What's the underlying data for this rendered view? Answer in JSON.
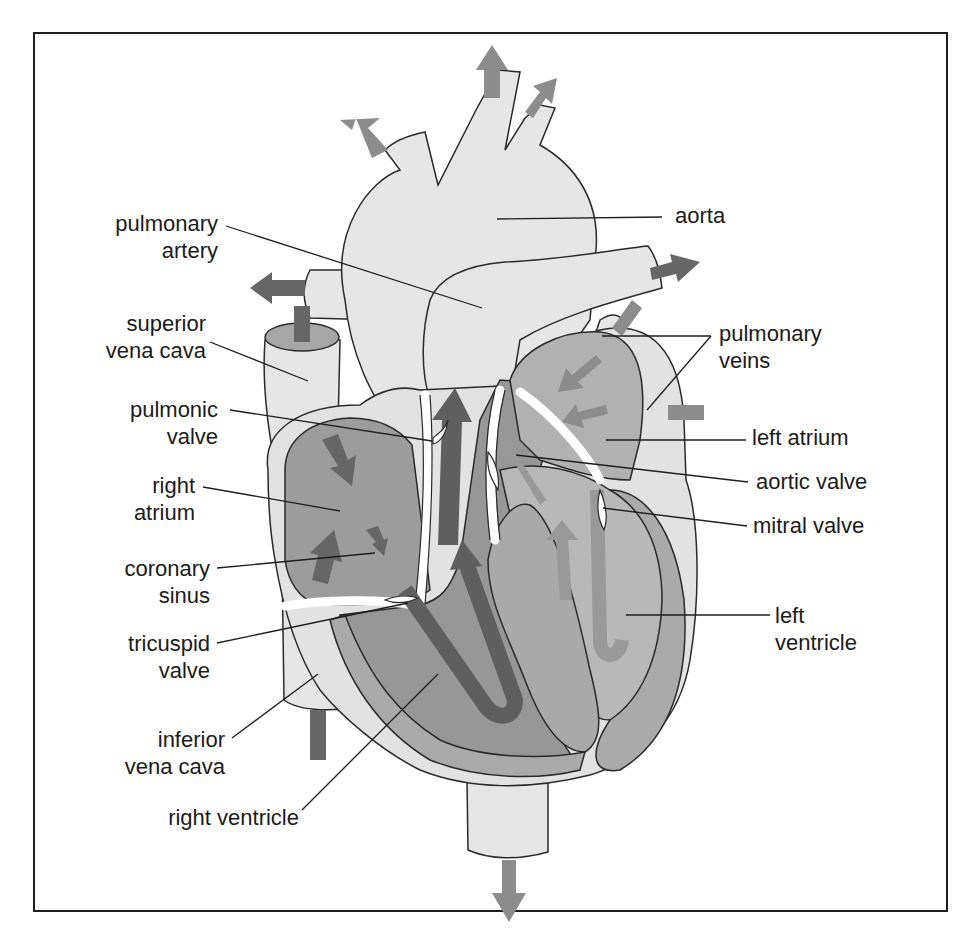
{
  "diagram": {
    "colors": {
      "background": "#ffffff",
      "frame": "#1f1f1f",
      "vessel_fill": "#e6e6e6",
      "chamber_right": "#9a9a9a",
      "chamber_left": "#b4b4b4",
      "muscle": "#a8a8a8",
      "arrow_dark": "#666666",
      "arrow_light": "#8e8e8e",
      "outline": "#2a2a2a",
      "text": "#1b1b1b"
    },
    "labels_left": [
      {
        "id": "pulmonary-artery",
        "lines": [
          "pulmonary",
          "artery"
        ]
      },
      {
        "id": "superior-vena-cava",
        "lines": [
          "superior",
          "vena cava"
        ]
      },
      {
        "id": "pulmonic-valve",
        "lines": [
          "pulmonic",
          "valve"
        ]
      },
      {
        "id": "right-atrium",
        "lines": [
          "right",
          "atrium"
        ]
      },
      {
        "id": "coronary-sinus",
        "lines": [
          "coronary",
          "sinus"
        ]
      },
      {
        "id": "tricuspid-valve",
        "lines": [
          "tricuspid",
          "valve"
        ]
      },
      {
        "id": "inferior-vena-cava",
        "lines": [
          "inferior",
          "vena cava"
        ]
      },
      {
        "id": "right-ventricle",
        "lines": [
          "right ventricle"
        ]
      }
    ],
    "labels_right": [
      {
        "id": "aorta",
        "lines": [
          "aorta"
        ]
      },
      {
        "id": "pulmonary-veins",
        "lines": [
          "pulmonary",
          "veins"
        ]
      },
      {
        "id": "left-atrium",
        "lines": [
          "left atrium"
        ]
      },
      {
        "id": "aortic-valve",
        "lines": [
          "aortic valve"
        ]
      },
      {
        "id": "mitral-valve",
        "lines": [
          "mitral valve"
        ]
      },
      {
        "id": "left-ventricle",
        "lines": [
          "left",
          "ventricle"
        ]
      }
    ]
  }
}
